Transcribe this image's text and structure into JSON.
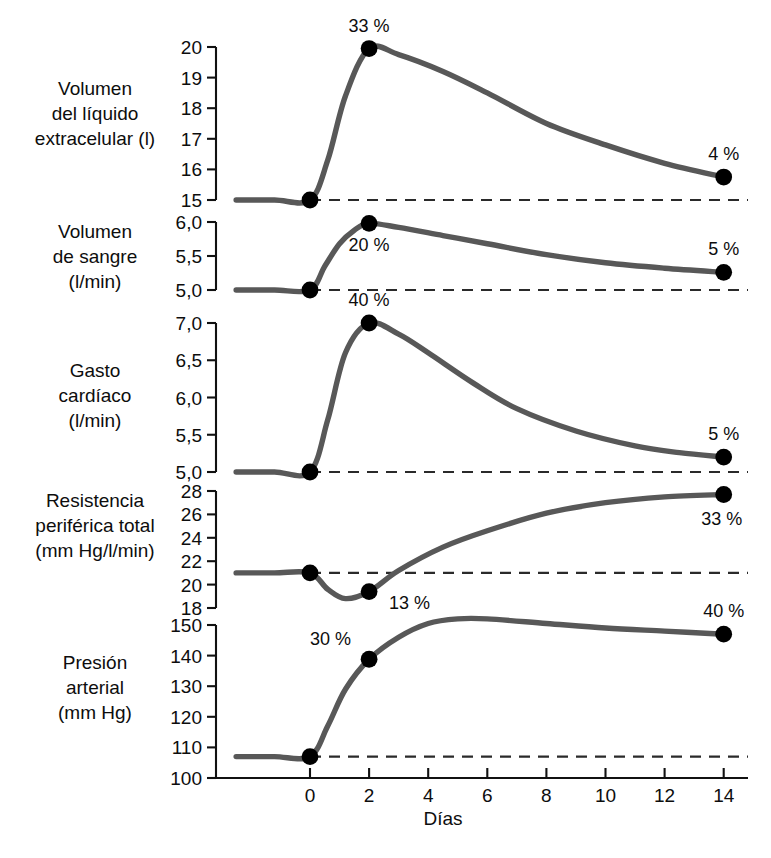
{
  "figure": {
    "background_color": "#ffffff",
    "curve_color": "#585858",
    "marker_color": "#000000",
    "axis_color": "#111111",
    "xlabel": "Días",
    "x_ticks": [
      "0",
      "2",
      "4",
      "6",
      "8",
      "10",
      "12",
      "14"
    ],
    "x_tick_values": [
      0,
      2,
      4,
      6,
      8,
      10,
      12,
      14
    ]
  },
  "panels": [
    {
      "label_lines": [
        "Volumen",
        "del líquido",
        "extracelular (l)"
      ],
      "y_ticks": [
        "20",
        "19",
        "18",
        "17",
        "16",
        "15"
      ],
      "annotations": [
        "33 %",
        "4 %"
      ]
    },
    {
      "label_lines": [
        "Volumen",
        "de sangre",
        "(l/min)"
      ],
      "y_ticks": [
        "6,0",
        "5,5",
        "5,0"
      ],
      "annotations": [
        "20 %",
        "5 %"
      ]
    },
    {
      "label_lines": [
        "Gasto",
        "cardíaco",
        "(l/min)"
      ],
      "y_ticks": [
        "7,0",
        "6,5",
        "6,0",
        "5,5",
        "5,0"
      ],
      "annotations": [
        "40 %",
        "5 %"
      ]
    },
    {
      "label_lines": [
        "Resistencia",
        "periférica total",
        "(mm Hg/l/min)"
      ],
      "y_ticks": [
        "28",
        "26",
        "24",
        "22",
        "20",
        "18"
      ],
      "annotations": [
        "13 %",
        "33 %"
      ]
    },
    {
      "label_lines": [
        "Presión",
        "arterial",
        "(mm Hg)"
      ],
      "y_ticks": [
        "150",
        "140",
        "130",
        "120",
        "110",
        "100"
      ],
      "annotations": [
        "30 %",
        "40 %"
      ]
    }
  ],
  "chart_data": {
    "type": "line",
    "title": "",
    "xlabel": "Días",
    "x_unit": "days",
    "xlim": [
      -2.5,
      15.2
    ],
    "x_ticks": [
      0,
      2,
      4,
      6,
      8,
      10,
      12,
      14
    ],
    "grid": false,
    "legend": "none",
    "shared_x_axis": true,
    "panels": [
      {
        "name": "Volumen del líquido extracelular",
        "ylabel": "Volumen del líquido extracelular (l)",
        "yunit": "l",
        "ylim": [
          15,
          20
        ],
        "y_ticks": [
          20,
          19,
          18,
          17,
          16,
          15
        ],
        "baseline": 15,
        "baseline_dashed": true,
        "x": [
          -2.5,
          -1.2,
          0,
          0.6,
          1.2,
          2,
          3,
          4.5,
          6,
          8,
          10,
          12,
          14
        ],
        "y": [
          15,
          15,
          15,
          16.3,
          18.4,
          19.95,
          19.75,
          19.2,
          18.5,
          17.5,
          16.8,
          16.2,
          15.75
        ],
        "markers": [
          {
            "x": 0,
            "y": 15,
            "label": ""
          },
          {
            "x": 2,
            "y": 19.95,
            "label": "33 %",
            "label_position": "above"
          },
          {
            "x": 14,
            "y": 15.75,
            "label": "4 %",
            "label_position": "above"
          }
        ]
      },
      {
        "name": "Volumen de sangre",
        "ylabel": "Volumen de sangre (l/min)",
        "yunit": "l/min",
        "ylim": [
          5.0,
          6.0
        ],
        "y_ticks": [
          6.0,
          5.5,
          5.0
        ],
        "baseline": 5.0,
        "baseline_dashed": true,
        "x": [
          -2.5,
          -1.2,
          0,
          0.5,
          1.0,
          1.5,
          2,
          3,
          4.5,
          6,
          8,
          10,
          12,
          14
        ],
        "y": [
          5.0,
          5.0,
          5.0,
          5.35,
          5.68,
          5.88,
          5.98,
          5.92,
          5.8,
          5.68,
          5.52,
          5.4,
          5.32,
          5.26
        ],
        "markers": [
          {
            "x": 0,
            "y": 5.0,
            "label": ""
          },
          {
            "x": 2,
            "y": 5.98,
            "label": "20 %",
            "label_position": "below"
          },
          {
            "x": 14,
            "y": 5.26,
            "label": "5 %",
            "label_position": "above"
          }
        ]
      },
      {
        "name": "Gasto cardíaco",
        "ylabel": "Gasto cardíaco (l/min)",
        "yunit": "l/min",
        "ylim": [
          5.0,
          7.0
        ],
        "y_ticks": [
          7.0,
          6.5,
          6.0,
          5.5,
          5.0
        ],
        "baseline": 5.0,
        "baseline_dashed": true,
        "x": [
          -2.5,
          -1.2,
          0,
          0.6,
          1.2,
          2,
          3,
          4,
          5.5,
          7,
          9,
          11,
          12.5,
          14
        ],
        "y": [
          5.0,
          5.0,
          5.0,
          5.7,
          6.6,
          7.0,
          6.85,
          6.6,
          6.2,
          5.85,
          5.55,
          5.35,
          5.26,
          5.2
        ],
        "markers": [
          {
            "x": 0,
            "y": 5.0,
            "label": ""
          },
          {
            "x": 2,
            "y": 7.0,
            "label": "40 %",
            "label_position": "above"
          },
          {
            "x": 14,
            "y": 5.2,
            "label": "5 %",
            "label_position": "above"
          }
        ]
      },
      {
        "name": "Resistencia periférica total",
        "ylabel": "Resistencia periférica total (mm Hg/l/min)",
        "yunit": "mm Hg/l/min",
        "ylim": [
          18,
          28
        ],
        "y_ticks": [
          28,
          26,
          24,
          22,
          20,
          18
        ],
        "baseline": 21,
        "baseline_dashed": true,
        "x": [
          -2.5,
          -1.2,
          0,
          0.6,
          1.2,
          2,
          3,
          4.5,
          6,
          8,
          10,
          12,
          14
        ],
        "y": [
          21,
          21,
          21,
          19.6,
          18.8,
          19.4,
          21.2,
          23.2,
          24.6,
          26.1,
          27.0,
          27.5,
          27.7
        ],
        "markers": [
          {
            "x": 0,
            "y": 21,
            "label": ""
          },
          {
            "x": 2,
            "y": 19.4,
            "label": "13 %",
            "label_position": "right"
          },
          {
            "x": 14,
            "y": 27.7,
            "label": "33 %",
            "label_position": "below-right"
          }
        ]
      },
      {
        "name": "Presión arterial",
        "ylabel": "Presión arterial (mm Hg)",
        "yunit": "mm Hg",
        "ylim": [
          100,
          150
        ],
        "y_ticks": [
          150,
          140,
          130,
          120,
          110,
          100
        ],
        "baseline": 107,
        "baseline_dashed": true,
        "x": [
          -2.5,
          -1.2,
          0,
          0.6,
          1.2,
          2,
          3,
          4,
          5,
          6,
          8,
          10,
          12,
          14
        ],
        "y": [
          107,
          107,
          107,
          117,
          129,
          138.8,
          146,
          150.5,
          152,
          152,
          150.5,
          149,
          148,
          147
        ],
        "markers": [
          {
            "x": 0,
            "y": 107,
            "label": ""
          },
          {
            "x": 2,
            "y": 138.8,
            "label": "30 %",
            "label_position": "above-left"
          },
          {
            "x": 14,
            "y": 147,
            "label": "40 %",
            "label_position": "above"
          }
        ]
      }
    ]
  }
}
